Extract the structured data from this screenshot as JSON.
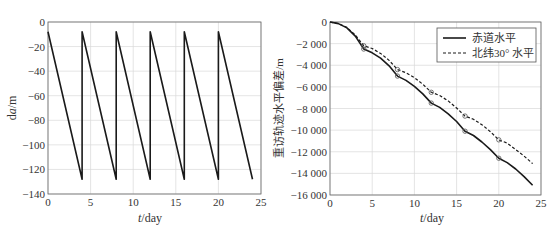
{
  "chart_data": [
    {
      "type": "line",
      "title": "",
      "xlabel": "t/day",
      "ylabel": "da/m",
      "xlim": [
        0,
        25
      ],
      "ylim": [
        -140,
        0
      ],
      "xticks": [
        0,
        5,
        10,
        15,
        20,
        25
      ],
      "yticks": [
        0,
        -20,
        -40,
        -60,
        -80,
        -100,
        -120,
        -140
      ],
      "grid": true,
      "legend": null,
      "series": [
        {
          "name": "da",
          "style": "solid",
          "color": "#1a1a1a",
          "x": [
            0,
            4,
            4,
            8,
            8,
            12,
            12,
            16,
            16,
            20,
            20,
            24
          ],
          "y": [
            -8,
            -128,
            -8,
            -128,
            -8,
            -128,
            -8,
            -128,
            -8,
            -128,
            -8,
            -128
          ]
        }
      ]
    },
    {
      "type": "line",
      "title": "",
      "xlabel": "t/day",
      "ylabel": "重访轨迹水平偏差/m",
      "xlim": [
        0,
        25
      ],
      "ylim": [
        -16000,
        0
      ],
      "xticks": [
        0,
        5,
        10,
        15,
        20,
        25
      ],
      "yticks": [
        0,
        -2000,
        -4000,
        -6000,
        -8000,
        -10000,
        -12000,
        -14000,
        -16000
      ],
      "ytick_labels": [
        "0",
        "-2 000",
        "-4 000",
        "-6 000",
        "-8 000",
        "-10 000",
        "-12 000",
        "-14 000",
        "-16 000"
      ],
      "grid": true,
      "legend_position": "upper right",
      "series": [
        {
          "name": "赤道水平",
          "style": "solid",
          "color": "#1a1a1a",
          "markers_at": [
            4,
            8,
            12,
            16,
            20
          ],
          "x": [
            0,
            1,
            2,
            3,
            4,
            5,
            6,
            7,
            8,
            9,
            10,
            11,
            12,
            13,
            14,
            15,
            16,
            17,
            18,
            19,
            20,
            21,
            22,
            23,
            24
          ],
          "y": [
            0,
            -150,
            -550,
            -1300,
            -2500,
            -2850,
            -3350,
            -4050,
            -5000,
            -5400,
            -5950,
            -6650,
            -7500,
            -7900,
            -8500,
            -9200,
            -10100,
            -10500,
            -11100,
            -11800,
            -12600,
            -13000,
            -13600,
            -14300,
            -15100
          ]
        },
        {
          "name": "北纬30° 水平",
          "style": "dashed",
          "color": "#1a1a1a",
          "markers_at": [
            4,
            8,
            12,
            16,
            20
          ],
          "x": [
            0,
            1,
            2,
            3,
            4,
            5,
            6,
            7,
            8,
            9,
            10,
            11,
            12,
            13,
            14,
            15,
            16,
            17,
            18,
            19,
            20,
            21,
            22,
            23,
            24
          ],
          "y": [
            0,
            -150,
            -500,
            -1200,
            -2200,
            -2450,
            -2900,
            -3550,
            -4400,
            -4700,
            -5150,
            -5750,
            -6500,
            -6800,
            -7300,
            -7950,
            -8700,
            -9000,
            -9500,
            -10150,
            -10900,
            -11200,
            -11800,
            -12400,
            -13100
          ]
        }
      ]
    }
  ],
  "labels": {
    "left_xlabel_italic": "t",
    "left_xlabel_rest": "/day",
    "left_ylabel_pre": "d",
    "left_ylabel_italic": "a",
    "left_ylabel_post": "/m",
    "right_xlabel_italic": "t",
    "right_xlabel_rest": "/day",
    "right_ylabel": "重访轨迹水平偏差/m",
    "legend_solid": "赤道水平",
    "legend_dashed": "北纬30° 水平"
  }
}
